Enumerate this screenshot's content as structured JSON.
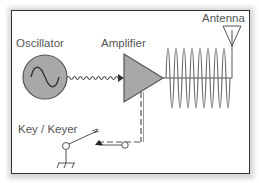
{
  "diagram": {
    "labels": {
      "oscillator": "Oscillator",
      "amplifier": "Amplifier",
      "antenna": "Antenna",
      "key": "Key / Keyer"
    },
    "colors": {
      "frame": "#333333",
      "fill": "#a8a8a8",
      "stroke": "#555555",
      "text": "#555555"
    },
    "components": [
      {
        "id": "oscillator",
        "type": "circle-sine-source"
      },
      {
        "id": "amplifier",
        "type": "triangle"
      },
      {
        "id": "antenna",
        "type": "inverted-triangle-antenna"
      },
      {
        "id": "key",
        "type": "switch-with-ground"
      }
    ],
    "connections": [
      {
        "from": "oscillator",
        "to": "amplifier",
        "style": "small-wave"
      },
      {
        "from": "amplifier",
        "to": "antenna",
        "style": "large-wave"
      },
      {
        "from": "key",
        "to": "amplifier",
        "style": "dashed-control"
      }
    ]
  }
}
